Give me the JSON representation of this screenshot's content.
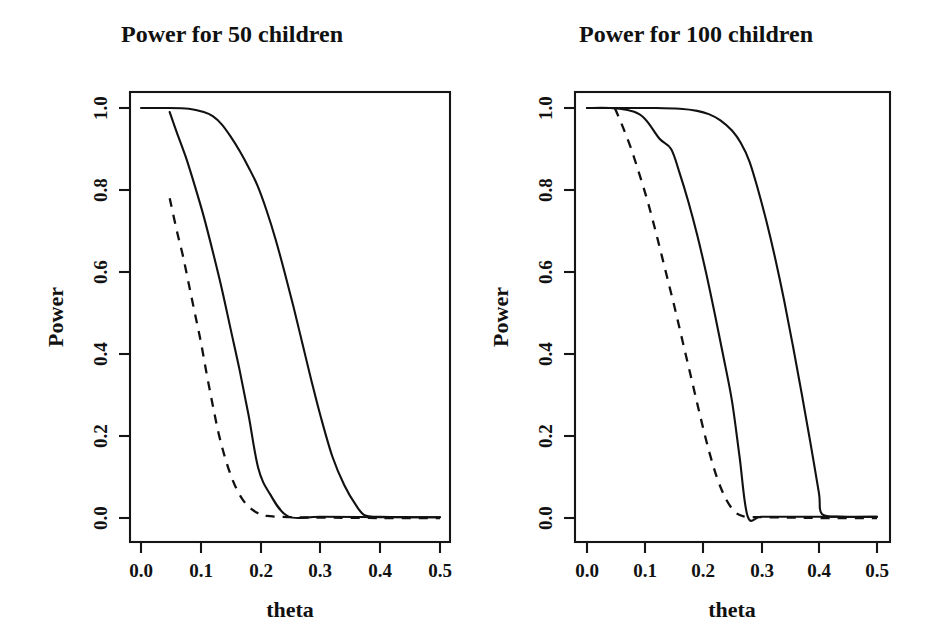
{
  "figure": {
    "background": "#ffffff",
    "ink_color": "#111111",
    "panel_count": 2
  },
  "chart_data": [
    {
      "type": "line",
      "title": "Power for 50 children",
      "xlabel": "theta",
      "ylabel": "Power",
      "xlim": [
        0.0,
        0.5
      ],
      "ylim": [
        0.0,
        1.0
      ],
      "xticks": [
        0.0,
        0.1,
        0.2,
        0.3,
        0.4,
        0.5
      ],
      "xtick_labels": [
        "0.0",
        "0.1",
        "0.2",
        "0.3",
        "0.4",
        "0.5"
      ],
      "yticks": [
        0.0,
        0.2,
        0.4,
        0.6,
        0.8,
        1.0
      ],
      "ytick_labels": [
        "0.0",
        "0.2",
        "0.4",
        "0.6",
        "0.8",
        "1.0"
      ],
      "grid": false,
      "legend": "none",
      "series": [
        {
          "name": "curve-dashed-left",
          "style": "dashed",
          "x": [
            0.048,
            0.06,
            0.07,
            0.08,
            0.09,
            0.1,
            0.11,
            0.12,
            0.13,
            0.14,
            0.15,
            0.16,
            0.17,
            0.18,
            0.195,
            0.21,
            0.25,
            0.3,
            0.4,
            0.5
          ],
          "y": [
            0.78,
            0.7,
            0.64,
            0.57,
            0.5,
            0.43,
            0.35,
            0.275,
            0.205,
            0.15,
            0.105,
            0.07,
            0.045,
            0.028,
            0.012,
            0.005,
            0.002,
            0.001,
            0.0,
            0.0
          ]
        },
        {
          "name": "curve-solid-middle-left",
          "style": "solid",
          "x": [
            0.048,
            0.06,
            0.075,
            0.09,
            0.105,
            0.12,
            0.135,
            0.15,
            0.165,
            0.18,
            0.196,
            0.215,
            0.246,
            0.3,
            0.4,
            0.5
          ],
          "y": [
            0.99,
            0.94,
            0.88,
            0.81,
            0.735,
            0.65,
            0.56,
            0.46,
            0.36,
            0.25,
            0.122,
            0.06,
            0.004,
            0.003,
            0.002,
            0.002
          ]
        },
        {
          "name": "curve-solid-right-left",
          "style": "solid",
          "x": [
            0.0,
            0.04,
            0.08,
            0.105,
            0.12,
            0.135,
            0.15,
            0.165,
            0.18,
            0.195,
            0.21,
            0.225,
            0.24,
            0.255,
            0.27,
            0.285,
            0.3,
            0.32,
            0.34,
            0.36,
            0.375,
            0.4,
            0.45,
            0.5
          ],
          "y": [
            1.0,
            1.0,
            0.998,
            0.99,
            0.98,
            0.96,
            0.93,
            0.895,
            0.855,
            0.81,
            0.75,
            0.68,
            0.6,
            0.515,
            0.425,
            0.335,
            0.25,
            0.15,
            0.08,
            0.03,
            0.006,
            0.003,
            0.002,
            0.002
          ]
        }
      ]
    },
    {
      "type": "line",
      "title": "Power for 100 children",
      "xlabel": "theta",
      "ylabel": "Power",
      "xlim": [
        0.0,
        0.5
      ],
      "ylim": [
        0.0,
        1.0
      ],
      "xticks": [
        0.0,
        0.1,
        0.2,
        0.3,
        0.4,
        0.5
      ],
      "xtick_labels": [
        "0.0",
        "0.1",
        "0.2",
        "0.3",
        "0.4",
        "0.5"
      ],
      "yticks": [
        0.0,
        0.2,
        0.4,
        0.6,
        0.8,
        1.0
      ],
      "ytick_labels": [
        "0.0",
        "0.2",
        "0.4",
        "0.6",
        "0.8",
        "1.0"
      ],
      "grid": false,
      "legend": "none",
      "series": [
        {
          "name": "curve-dashed-right",
          "style": "dashed",
          "x": [
            0.048,
            0.06,
            0.075,
            0.09,
            0.105,
            0.12,
            0.135,
            0.15,
            0.165,
            0.18,
            0.195,
            0.21,
            0.225,
            0.24,
            0.255,
            0.27,
            0.3,
            0.35,
            0.4,
            0.5
          ],
          "y": [
            1.0,
            0.96,
            0.905,
            0.84,
            0.77,
            0.69,
            0.605,
            0.52,
            0.43,
            0.34,
            0.25,
            0.165,
            0.095,
            0.045,
            0.015,
            0.004,
            0.002,
            0.001,
            0.0,
            0.0
          ]
        },
        {
          "name": "curve-solid-middle-right",
          "style": "solid",
          "x": [
            0.0,
            0.04,
            0.07,
            0.09,
            0.105,
            0.125,
            0.145,
            0.16,
            0.175,
            0.19,
            0.205,
            0.22,
            0.235,
            0.25,
            0.263,
            0.277,
            0.3,
            0.35,
            0.4,
            0.5
          ],
          "y": [
            1.0,
            1.0,
            0.995,
            0.985,
            0.965,
            0.925,
            0.9,
            0.84,
            0.77,
            0.69,
            0.6,
            0.5,
            0.395,
            0.285,
            0.15,
            0.004,
            0.003,
            0.003,
            0.003,
            0.003
          ]
        },
        {
          "name": "curve-solid-right-right",
          "style": "solid",
          "x": [
            0.0,
            0.06,
            0.12,
            0.16,
            0.19,
            0.21,
            0.23,
            0.25,
            0.265,
            0.28,
            0.295,
            0.31,
            0.325,
            0.34,
            0.355,
            0.37,
            0.385,
            0.4,
            0.405,
            0.44,
            0.5
          ],
          "y": [
            1.0,
            1.0,
            1.0,
            0.998,
            0.993,
            0.985,
            0.97,
            0.945,
            0.915,
            0.87,
            0.8,
            0.72,
            0.63,
            0.53,
            0.42,
            0.305,
            0.185,
            0.06,
            0.01,
            0.003,
            0.003
          ]
        }
      ]
    }
  ]
}
